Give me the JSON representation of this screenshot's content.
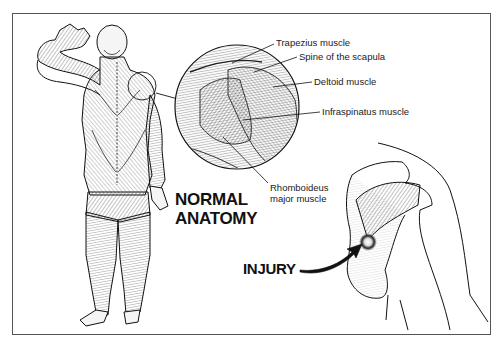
{
  "figure": {
    "title_lines": [
      "NORMAL",
      "ANATOMY"
    ],
    "injury_label": "INJURY",
    "labels": {
      "trapezius": "Trapezius muscle",
      "spine_scapula": "Spine of the scapula",
      "deltoid": "Deltoid muscle",
      "infraspinatus": "Infraspinatus muscle",
      "rhomboideus_line1": "Rhomboideus",
      "rhomboideus_line2": "major muscle"
    },
    "panels": [
      {
        "name": "full-body-posterior-view",
        "description": "Back view of human musculature, right arm raised"
      },
      {
        "name": "shoulder-detail-magnified",
        "description": "Circular magnified inset of posterior shoulder muscles"
      },
      {
        "name": "shoulder-injury-view",
        "description": "Scapula and humerus with injury site on infraspinatus"
      }
    ],
    "colors": {
      "ink": "#1a1a1a",
      "frame": "#555555",
      "background": "#ffffff"
    }
  }
}
